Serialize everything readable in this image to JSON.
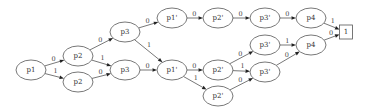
{
  "diagram": {
    "type": "binary-decision-diagram",
    "nodes": [
      {
        "id": "n_p1",
        "label": "p1",
        "shape": "ellipse",
        "cx": 31,
        "cy": 70
      },
      {
        "id": "n_p2a",
        "label": "p2",
        "shape": "ellipse",
        "cx": 78,
        "cy": 56
      },
      {
        "id": "n_p2b",
        "label": "p2",
        "shape": "ellipse",
        "cx": 78,
        "cy": 82
      },
      {
        "id": "n_p3a",
        "label": "p3",
        "shape": "ellipse",
        "cx": 125,
        "cy": 32
      },
      {
        "id": "n_p3b",
        "label": "p3",
        "shape": "ellipse",
        "cx": 125,
        "cy": 70
      },
      {
        "id": "n_p1pa",
        "label": "p1'",
        "shape": "ellipse",
        "cx": 172,
        "cy": 18
      },
      {
        "id": "n_p1pb",
        "label": "p1'",
        "shape": "ellipse",
        "cx": 172,
        "cy": 70
      },
      {
        "id": "n_p2pa",
        "label": "p2'",
        "shape": "ellipse",
        "cx": 218,
        "cy": 18
      },
      {
        "id": "n_p2pb",
        "label": "p2'",
        "shape": "ellipse",
        "cx": 218,
        "cy": 70
      },
      {
        "id": "n_p2pc",
        "label": "p2'",
        "shape": "ellipse",
        "cx": 218,
        "cy": 96
      },
      {
        "id": "n_p3pa",
        "label": "p3'",
        "shape": "ellipse",
        "cx": 265,
        "cy": 18
      },
      {
        "id": "n_p3pb",
        "label": "p3'",
        "shape": "ellipse",
        "cx": 265,
        "cy": 45
      },
      {
        "id": "n_p3pc",
        "label": "p3'",
        "shape": "ellipse",
        "cx": 265,
        "cy": 72
      },
      {
        "id": "n_p4a",
        "label": "p4",
        "shape": "ellipse",
        "cx": 311,
        "cy": 18
      },
      {
        "id": "n_p4b",
        "label": "p4",
        "shape": "ellipse",
        "cx": 311,
        "cy": 45
      },
      {
        "id": "n_one",
        "label": "1",
        "shape": "box",
        "cx": 346,
        "cy": 32
      }
    ],
    "edges": [
      {
        "from": "n_p1",
        "to": "n_p2a",
        "label": "0"
      },
      {
        "from": "n_p1",
        "to": "n_p2b",
        "label": "1"
      },
      {
        "from": "n_p2a",
        "to": "n_p3a",
        "label": "0"
      },
      {
        "from": "n_p2a",
        "to": "n_p3b",
        "label": "1"
      },
      {
        "from": "n_p2b",
        "to": "n_p3b",
        "label": "0"
      },
      {
        "from": "n_p3a",
        "to": "n_p1pa",
        "label": "0"
      },
      {
        "from": "n_p3a",
        "to": "n_p1pb",
        "label": "1"
      },
      {
        "from": "n_p3b",
        "to": "n_p1pb",
        "label": "0"
      },
      {
        "from": "n_p1pa",
        "to": "n_p2pa",
        "label": "0"
      },
      {
        "from": "n_p2pa",
        "to": "n_p3pa",
        "label": "0"
      },
      {
        "from": "n_p3pa",
        "to": "n_p4a",
        "label": "0"
      },
      {
        "from": "n_p4a",
        "to": "n_one",
        "label": "1"
      },
      {
        "from": "n_p1pb",
        "to": "n_p2pb",
        "label": "0"
      },
      {
        "from": "n_p1pb",
        "to": "n_p2pc",
        "label": "1"
      },
      {
        "from": "n_p2pb",
        "to": "n_p3pb",
        "label": "0"
      },
      {
        "from": "n_p2pb",
        "to": "n_p3pc",
        "label": "1"
      },
      {
        "from": "n_p2pc",
        "to": "n_p3pc",
        "label": "0"
      },
      {
        "from": "n_p3pb",
        "to": "n_p4b",
        "label": "1"
      },
      {
        "from": "n_p3pc",
        "to": "n_p4b",
        "label": "0"
      },
      {
        "from": "n_p4b",
        "to": "n_one",
        "label": "0"
      }
    ]
  },
  "colors": {
    "stroke": "#555555",
    "arrow": "#222222",
    "text": "#333333",
    "background": "#ffffff"
  }
}
